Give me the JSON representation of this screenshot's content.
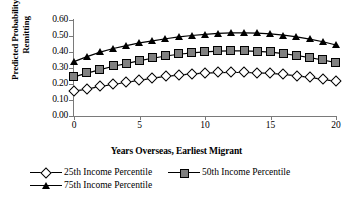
{
  "chart_data": {
    "type": "line",
    "title": "",
    "subtitle": "",
    "xlabel": "Years Overseas, Earliest Migrant",
    "ylabel": "Predicted Probability of Remitting",
    "xlim": [
      0,
      20
    ],
    "ylim": [
      0.0,
      0.6
    ],
    "xticks": [
      "0",
      "5",
      "10",
      "15",
      "20"
    ],
    "xtick_values": [
      0,
      5,
      10,
      15,
      20
    ],
    "yticks": [
      "0.00",
      "0.10",
      "0.20",
      "0.30",
      "0.40",
      "0.50",
      "0.60"
    ],
    "ytick_values": [
      0.0,
      0.1,
      0.2,
      0.3,
      0.4,
      0.5,
      0.6
    ],
    "grid": false,
    "legend_position": "bottom",
    "x": [
      0,
      1,
      2,
      3,
      4,
      5,
      6,
      7,
      8,
      9,
      10,
      11,
      12,
      13,
      14,
      15,
      16,
      17,
      18,
      19,
      20
    ],
    "series": [
      {
        "name": "25th Income Percentile",
        "marker": "open-diamond",
        "color": "#000000",
        "marker_fill": "#ffffff",
        "values": [
          0.155,
          0.168,
          0.185,
          0.197,
          0.211,
          0.223,
          0.237,
          0.248,
          0.256,
          0.263,
          0.268,
          0.271,
          0.272,
          0.272,
          0.27,
          0.266,
          0.26,
          0.251,
          0.241,
          0.229,
          0.216
        ]
      },
      {
        "name": "50th Income Percentile",
        "marker": "gray-square",
        "color": "#000000",
        "marker_fill": "#808080",
        "values": [
          0.245,
          0.268,
          0.29,
          0.311,
          0.327,
          0.346,
          0.361,
          0.375,
          0.386,
          0.395,
          0.401,
          0.405,
          0.407,
          0.407,
          0.404,
          0.399,
          0.39,
          0.378,
          0.365,
          0.35,
          0.334
        ]
      },
      {
        "name": "75th Income Percentile",
        "marker": "filled-triangle",
        "color": "#000000",
        "marker_fill": "#000000",
        "values": [
          0.34,
          0.371,
          0.399,
          0.422,
          0.44,
          0.457,
          0.47,
          0.483,
          0.494,
          0.503,
          0.51,
          0.516,
          0.519,
          0.52,
          0.518,
          0.513,
          0.505,
          0.494,
          0.481,
          0.464,
          0.444
        ]
      }
    ]
  },
  "legend": {
    "entries": [
      {
        "label": "25th Income Percentile",
        "marker": "open-diamond"
      },
      {
        "label": "50th Income Percentile",
        "marker": "gray-square"
      },
      {
        "label": "75th Income Percentile",
        "marker": "filled-triangle"
      }
    ]
  },
  "axes": {
    "x_title": "Years Overseas, Earliest Migrant",
    "y_title_line1": "Predicted Probability of",
    "y_title_line2": "Remitting"
  }
}
